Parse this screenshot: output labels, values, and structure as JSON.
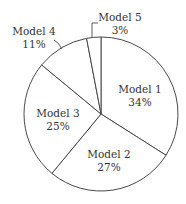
{
  "chart_data": {
    "type": "pie",
    "title": "",
    "start_angle_deg": 0,
    "direction": "clockwise",
    "categories": [
      "Model 1",
      "Model 2",
      "Model 3",
      "Model 4",
      "Model 5"
    ],
    "values": [
      34,
      27,
      25,
      11,
      3
    ],
    "value_labels": [
      "34%",
      "27%",
      "25%",
      "11%",
      "3%"
    ],
    "unit": "%",
    "legend": null,
    "slice_fill": "#ffffff",
    "slice_stroke": "#4a4a4a",
    "labels_outside": [
      "Model 4",
      "Model 5"
    ]
  }
}
